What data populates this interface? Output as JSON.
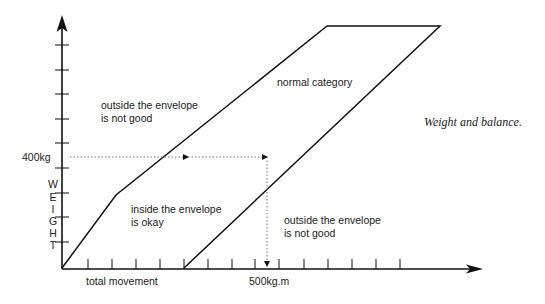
{
  "diagram": {
    "y_axis": {
      "label_letters": [
        "W",
        "E",
        "I",
        "G",
        "H",
        "T"
      ],
      "marker_label": "400kg"
    },
    "x_axis": {
      "label": "total movement",
      "marker_label": "500kg.m"
    },
    "regions": {
      "outside_upper": [
        "outside the envelope",
        "is not good"
      ],
      "inside": [
        "inside the envelope",
        "is okay"
      ],
      "outside_lower": [
        "outside the envelope",
        "is not good"
      ],
      "normal": "normal category"
    },
    "caption": "Weight and balance."
  }
}
